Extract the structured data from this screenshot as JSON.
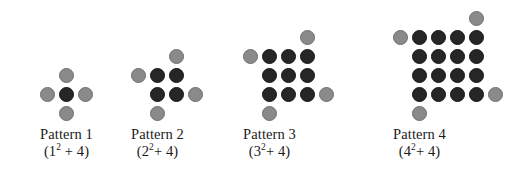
{
  "figure": {
    "background_color": "#ffffff",
    "dot_colors": {
      "dark": "#262626",
      "gray": "#8a8a8a"
    },
    "grid_spacing_px": 19,
    "dot_diameter_px": 15,
    "patterns": [
      {
        "id": "pattern-1",
        "n": 1,
        "label": "Pattern 1",
        "expression_base": "(1",
        "expression_exponent": "2",
        "expression_tail": " + 4)",
        "expression_plain": "(1^2 + 4)",
        "dark_count": 1,
        "gray_count": 4,
        "total_count": 5,
        "square_rows": 1,
        "square_cols": 1,
        "gray_positions": [
          "above-top-right",
          "left-of-top-row",
          "right-of-bottom-row",
          "below-bottom-left"
        ]
      },
      {
        "id": "pattern-2",
        "n": 2,
        "label": "Pattern 2",
        "expression_base": "(2",
        "expression_exponent": "2",
        "expression_tail": "+ 4)",
        "expression_plain": "(2^2 + 4)",
        "dark_count": 4,
        "gray_count": 4,
        "total_count": 8,
        "square_rows": 2,
        "square_cols": 2,
        "gray_positions": [
          "above-top-right",
          "left-of-top-row",
          "right-of-bottom-row",
          "below-bottom-left"
        ]
      },
      {
        "id": "pattern-3",
        "n": 3,
        "label": "Pattern 3",
        "expression_base": "(3",
        "expression_exponent": "2",
        "expression_tail": "+ 4)",
        "expression_plain": "(3^2 + 4)",
        "dark_count": 9,
        "gray_count": 4,
        "total_count": 13,
        "square_rows": 3,
        "square_cols": 3,
        "gray_positions": [
          "above-top-right",
          "left-of-top-row",
          "right-of-bottom-row",
          "below-bottom-left"
        ]
      },
      {
        "id": "pattern-4",
        "n": 4,
        "label": "Pattern 4",
        "expression_base": "(4",
        "expression_exponent": "2",
        "expression_tail": "+ 4)",
        "expression_plain": "(4^2 + 4)",
        "dark_count": 16,
        "gray_count": 4,
        "total_count": 20,
        "square_rows": 4,
        "square_cols": 4,
        "gray_positions": [
          "above-top-right",
          "left-of-top-row",
          "right-of-bottom-row",
          "below-bottom-left"
        ]
      }
    ]
  }
}
